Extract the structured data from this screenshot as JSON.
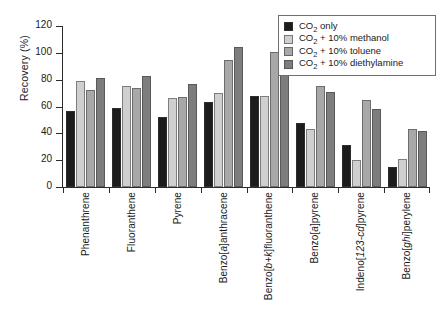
{
  "chart_data": {
    "type": "bar",
    "title": "",
    "xlabel": "",
    "ylabel": "Recovery (%)",
    "ylim": [
      0,
      120
    ],
    "ytick_values": [
      0,
      20,
      40,
      60,
      80,
      100,
      120
    ],
    "ytick_labels": [
      "0",
      "20",
      "40",
      "60",
      "80",
      "100",
      "120"
    ],
    "grid": false,
    "legend_position": "top-right",
    "categories": [
      "Phenanthrene",
      "Fluoranthene",
      "Pyrene",
      "Benzo[a]anthracene",
      "Benzo[b+k]fluoranthene",
      "Benzo[a]pyrene",
      "Indeno[123-cd]pyrene",
      "Benzo[ghi]perylene"
    ],
    "series": [
      {
        "name": "CO2 only",
        "label_html": "CO<sub>2</sub> only",
        "color": "#1c1c1c",
        "values": [
          57,
          59,
          52,
          63,
          68,
          48,
          31,
          15
        ]
      },
      {
        "name": "CO2 + 10% methanol",
        "label_html": "CO<sub>2</sub> + 10% methanol",
        "color": "#cfcfcf",
        "values": [
          79,
          75,
          66,
          70,
          68,
          43,
          20,
          21
        ]
      },
      {
        "name": "CO2 + 10% toluene",
        "label_html": "CO<sub>2</sub> + 10% toluene",
        "color": "#a8a8a8",
        "values": [
          72,
          74,
          67,
          95,
          101,
          75,
          65,
          43
        ]
      },
      {
        "name": "CO2 + 10% diethylamine",
        "label_html": "CO<sub>2</sub> + 10% diethylamine",
        "color": "#7d7d7d",
        "values": [
          81,
          83,
          77,
          104,
          106,
          71,
          58,
          42
        ]
      }
    ]
  }
}
